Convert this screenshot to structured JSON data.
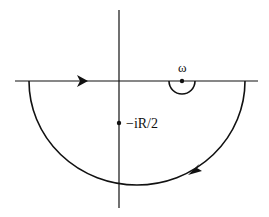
{
  "diagram": {
    "type": "contour",
    "labels": {
      "omega": "ω",
      "pole": "−iR/2"
    },
    "elements": {
      "real_axis": "horizontal real axis",
      "imag_axis": "vertical imaginary axis",
      "large_arc": "lower semicircle of radius R, traversed clockwise",
      "indentation": "small semicircular detour below the point ω",
      "arrows": [
        "rightward along real axis",
        "clockwise along lower arc"
      ]
    },
    "colors": {
      "stroke": "#111111",
      "background": "#ffffff"
    }
  }
}
